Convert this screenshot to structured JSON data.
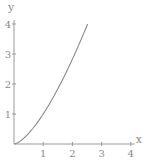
{
  "chart_data": {
    "type": "line",
    "title": "",
    "xlabel": "x",
    "ylabel": "y",
    "xlim": [
      0,
      4
    ],
    "ylim": [
      0,
      4
    ],
    "grid": false,
    "x_ticks": [
      "1",
      "2",
      "3",
      "4"
    ],
    "y_ticks": [
      "1",
      "2",
      "3",
      "4"
    ],
    "series": [
      {
        "name": "y = x^(3/2)",
        "x": [
          0,
          0.25,
          0.5,
          0.75,
          1.0,
          1.25,
          1.5,
          1.75,
          2.0,
          2.25,
          2.52
        ],
        "y": [
          0,
          0.125,
          0.354,
          0.65,
          1.0,
          1.398,
          1.837,
          2.315,
          2.828,
          3.375,
          4.0
        ]
      }
    ],
    "colors": {
      "axis": "#9a9a9a",
      "curve": "#8a8a8a",
      "text": "#8a8a8a"
    }
  }
}
